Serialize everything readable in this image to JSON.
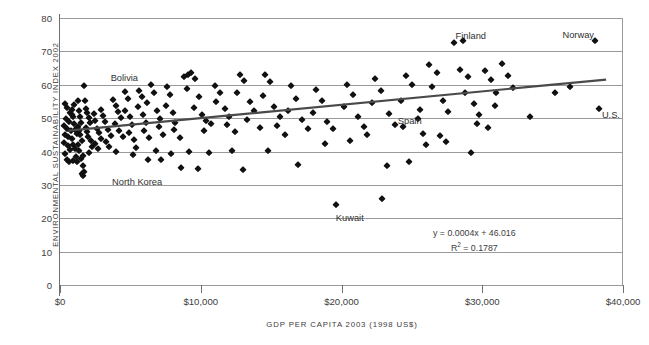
{
  "chart_data": {
    "type": "scatter",
    "title": "",
    "xlabel": "GDP PER CAPITA 2003 (1998 US$)",
    "ylabel": "ENVIRONMENTAL SUSTAINABILITY INDEX 2002",
    "xlim": [
      0,
      40000
    ],
    "ylim": [
      0,
      80
    ],
    "x_ticks": [
      0,
      10000,
      20000,
      30000,
      40000
    ],
    "x_tick_labels": [
      "$0",
      "$10,000",
      "$20,000",
      "$30,000",
      "$40,000"
    ],
    "y_ticks": [
      0,
      10,
      20,
      30,
      40,
      50,
      60,
      70,
      80
    ],
    "y_tick_labels": [
      "0",
      "10",
      "20",
      "30",
      "40",
      "50",
      "60",
      "70",
      "80"
    ],
    "grid": "horizontal",
    "legend": "none",
    "marker": "diamond",
    "marker_color": "#111111",
    "gridline_color": "#9a9a9a",
    "trendline": {
      "equation": "y = 0.0004x + 46.016",
      "r_squared_label": "R",
      "r_squared_exponent": "2",
      "r_squared_value": "= 0.1787",
      "slope": 0.0004,
      "intercept": 46.016,
      "r2": 0.1787,
      "color": "#4a4a4a",
      "x_start": 600,
      "x_end": 38800
    },
    "annotations": [
      {
        "text": "Bolivia",
        "x": 3600,
        "y": 63.5
      },
      {
        "text": "North Korea",
        "x": 3700,
        "y": 32.4
      },
      {
        "text": "Kuwait",
        "x": 19600,
        "y": 21.7
      },
      {
        "text": "Spain",
        "x": 24000,
        "y": 50.6
      },
      {
        "text": "Finland",
        "x": 28100,
        "y": 76.0
      },
      {
        "text": "Norway",
        "x": 35700,
        "y": 76.3
      },
      {
        "text": "U.S.",
        "x": 38500,
        "y": 52.4
      }
    ],
    "points": [
      [
        350,
        54.2
      ],
      [
        520,
        53.0
      ],
      [
        700,
        51.5
      ],
      [
        430,
        49.6
      ],
      [
        640,
        48.9
      ],
      [
        300,
        47.6
      ],
      [
        480,
        46.8
      ],
      [
        760,
        46.2
      ],
      [
        380,
        45.0
      ],
      [
        600,
        44.2
      ],
      [
        260,
        42.5
      ],
      [
        540,
        41.6
      ],
      [
        700,
        40.3
      ],
      [
        330,
        39.2
      ],
      [
        470,
        37.5
      ],
      [
        620,
        36.8
      ],
      [
        880,
        52.5
      ],
      [
        950,
        50.4
      ],
      [
        1020,
        48.2
      ],
      [
        1100,
        46.5
      ],
      [
        1180,
        45.2
      ],
      [
        860,
        43.6
      ],
      [
        940,
        42.0
      ],
      [
        1060,
        40.6
      ],
      [
        1140,
        38.4
      ],
      [
        900,
        37.2
      ],
      [
        1230,
        36.9
      ],
      [
        820,
        51.0
      ],
      [
        1000,
        53.8
      ],
      [
        1300,
        55.2
      ],
      [
        1380,
        52.0
      ],
      [
        1450,
        50.2
      ],
      [
        1520,
        48.6
      ],
      [
        1270,
        47.4
      ],
      [
        1340,
        46.0
      ],
      [
        1420,
        44.8
      ],
      [
        1560,
        43.2
      ],
      [
        1250,
        41.8
      ],
      [
        1330,
        40.2
      ],
      [
        1600,
        38.6
      ],
      [
        1480,
        37.8
      ],
      [
        1660,
        35.6
      ],
      [
        1720,
        34.0
      ],
      [
        1560,
        33.2
      ],
      [
        1640,
        32.6
      ],
      [
        1800,
        55.0
      ],
      [
        1880,
        52.8
      ],
      [
        1950,
        51.4
      ],
      [
        2050,
        50.0
      ],
      [
        2130,
        48.4
      ],
      [
        1840,
        47.0
      ],
      [
        1920,
        45.8
      ],
      [
        2000,
        44.4
      ],
      [
        2200,
        43.0
      ],
      [
        2300,
        41.4
      ],
      [
        2080,
        39.6
      ],
      [
        2400,
        51.2
      ],
      [
        2520,
        49.0
      ],
      [
        2620,
        46.8
      ],
      [
        2750,
        45.4
      ],
      [
        2880,
        43.8
      ],
      [
        2460,
        42.2
      ],
      [
        2700,
        40.8
      ],
      [
        1700,
        59.5
      ],
      [
        2900,
        52.4
      ],
      [
        3050,
        50.6
      ],
      [
        3200,
        48.8
      ],
      [
        3400,
        46.4
      ],
      [
        3600,
        44.6
      ],
      [
        3250,
        42.8
      ],
      [
        3500,
        41.2
      ],
      [
        3800,
        55.3
      ],
      [
        4000,
        53.6
      ],
      [
        4100,
        51.8
      ],
      [
        4300,
        50.0
      ],
      [
        3900,
        48.2
      ],
      [
        4200,
        46.2
      ],
      [
        4450,
        44.4
      ],
      [
        4600,
        57.8
      ],
      [
        4800,
        55.6
      ],
      [
        4650,
        52.0
      ],
      [
        4950,
        50.4
      ],
      [
        5100,
        48.0
      ],
      [
        4900,
        45.6
      ],
      [
        5250,
        43.4
      ],
      [
        5400,
        41.0
      ],
      [
        5600,
        58.2
      ],
      [
        5800,
        56.2
      ],
      [
        5550,
        53.2
      ],
      [
        5900,
        51.0
      ],
      [
        6100,
        48.6
      ],
      [
        6000,
        46.0
      ],
      [
        6350,
        44.0
      ],
      [
        6500,
        59.8
      ],
      [
        6700,
        57.6
      ],
      [
        6200,
        54.4
      ],
      [
        6900,
        52.2
      ],
      [
        7100,
        49.6
      ],
      [
        7000,
        47.2
      ],
      [
        7350,
        45.0
      ],
      [
        7600,
        59.4
      ],
      [
        7800,
        56.8
      ],
      [
        7500,
        53.6
      ],
      [
        8000,
        51.4
      ],
      [
        8200,
        48.4
      ],
      [
        8100,
        46.4
      ],
      [
        8500,
        44.0
      ],
      [
        8800,
        62.2
      ],
      [
        9100,
        62.8
      ],
      [
        9300,
        63.4
      ],
      [
        9600,
        61.6
      ],
      [
        9000,
        58.6
      ],
      [
        9900,
        56.2
      ],
      [
        9500,
        53.0
      ],
      [
        10100,
        51.0
      ],
      [
        10400,
        49.0
      ],
      [
        10700,
        48.2
      ],
      [
        10200,
        46.0
      ],
      [
        11000,
        59.6
      ],
      [
        11400,
        57.6
      ],
      [
        11100,
        54.8
      ],
      [
        11700,
        52.6
      ],
      [
        12000,
        50.2
      ],
      [
        11900,
        48.0
      ],
      [
        12400,
        45.8
      ],
      [
        12800,
        63.0
      ],
      [
        13100,
        61.0
      ],
      [
        12600,
        57.4
      ],
      [
        13500,
        54.8
      ],
      [
        13800,
        52.0
      ],
      [
        13300,
        49.4
      ],
      [
        14200,
        47.0
      ],
      [
        14600,
        62.8
      ],
      [
        14900,
        60.8
      ],
      [
        14400,
        56.6
      ],
      [
        15200,
        53.2
      ],
      [
        15600,
        50.2
      ],
      [
        15400,
        47.6
      ],
      [
        16000,
        45.0
      ],
      [
        16400,
        59.6
      ],
      [
        16800,
        55.8
      ],
      [
        16200,
        52.2
      ],
      [
        17200,
        49.4
      ],
      [
        17600,
        46.6
      ],
      [
        6800,
        40.2
      ],
      [
        7900,
        39.4
      ],
      [
        9200,
        40.0
      ],
      [
        10600,
        39.6
      ],
      [
        12200,
        40.2
      ],
      [
        14800,
        40.2
      ],
      [
        3950,
        40.0
      ],
      [
        5200,
        39.0
      ],
      [
        6250,
        37.6
      ],
      [
        7200,
        37.4
      ],
      [
        8600,
        35.2
      ],
      [
        9800,
        34.8
      ],
      [
        13000,
        34.4
      ],
      [
        16900,
        36.0
      ],
      [
        19600,
        24.0
      ],
      [
        22900,
        25.8
      ],
      [
        18200,
        58.4
      ],
      [
        18600,
        55.2
      ],
      [
        18000,
        51.4
      ],
      [
        19000,
        48.8
      ],
      [
        19400,
        46.8
      ],
      [
        20400,
        59.8
      ],
      [
        20800,
        57.0
      ],
      [
        20200,
        53.2
      ],
      [
        21200,
        50.4
      ],
      [
        21600,
        47.2
      ],
      [
        22400,
        61.8
      ],
      [
        22800,
        58.2
      ],
      [
        22200,
        54.6
      ],
      [
        23400,
        51.2
      ],
      [
        23800,
        48.0
      ],
      [
        24600,
        62.6
      ],
      [
        25000,
        60.0
      ],
      [
        24200,
        55.0
      ],
      [
        25600,
        52.4
      ],
      [
        25400,
        49.6
      ],
      [
        26200,
        66.0
      ],
      [
        26800,
        63.6
      ],
      [
        26400,
        59.4
      ],
      [
        27200,
        55.2
      ],
      [
        27600,
        51.8
      ],
      [
        28000,
        72.4
      ],
      [
        28600,
        73.2
      ],
      [
        28400,
        64.4
      ],
      [
        29000,
        62.2
      ],
      [
        28800,
        57.6
      ],
      [
        29400,
        54.2
      ],
      [
        29800,
        50.8
      ],
      [
        30200,
        64.0
      ],
      [
        30600,
        61.4
      ],
      [
        31000,
        57.4
      ],
      [
        30900,
        53.6
      ],
      [
        31400,
        66.2
      ],
      [
        31800,
        62.6
      ],
      [
        32200,
        59.0
      ],
      [
        29200,
        39.6
      ],
      [
        27000,
        44.6
      ],
      [
        27400,
        42.8
      ],
      [
        26000,
        41.8
      ],
      [
        25800,
        45.2
      ],
      [
        29600,
        48.2
      ],
      [
        30400,
        47.0
      ],
      [
        24800,
        36.8
      ],
      [
        38000,
        73.2
      ],
      [
        38300,
        52.6
      ],
      [
        36200,
        59.4
      ],
      [
        35200,
        57.4
      ],
      [
        33400,
        50.4
      ],
      [
        23200,
        35.6
      ],
      [
        20600,
        43.0
      ],
      [
        18800,
        42.2
      ],
      [
        21800,
        44.8
      ],
      [
        24400,
        47.4
      ]
    ]
  }
}
